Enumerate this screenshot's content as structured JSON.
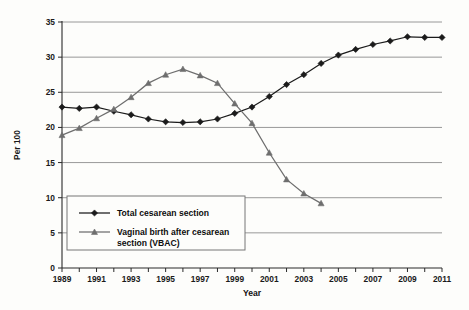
{
  "chart_data": {
    "type": "line",
    "title": "",
    "xlabel": "Year",
    "ylabel": "Per 100",
    "xlim": [
      1989,
      2011
    ],
    "ylim": [
      0,
      35
    ],
    "grid": true,
    "legend_position": "inside lower-left",
    "x": [
      1989,
      1990,
      1991,
      1992,
      1993,
      1994,
      1995,
      1996,
      1997,
      1998,
      1999,
      2000,
      2001,
      2002,
      2003,
      2004,
      2005,
      2006,
      2007,
      2008,
      2009,
      2010,
      2011
    ],
    "y_ticks": [
      0,
      5,
      10,
      15,
      20,
      25,
      30,
      35
    ],
    "x_tick_labels": [
      "1989",
      "",
      "1991",
      "",
      "1993",
      "",
      "1995",
      "",
      "1997",
      "",
      "1999",
      "",
      "2001",
      "",
      "2003",
      "",
      "2005",
      "",
      "2007",
      "",
      "2009",
      "",
      "2011"
    ],
    "series": [
      {
        "name": "Total cesarean section",
        "marker": "diamond",
        "color": "#1b1b1b",
        "x": [
          1989,
          1990,
          1991,
          1992,
          1993,
          1994,
          1995,
          1996,
          1997,
          1998,
          1999,
          2000,
          2001,
          2002,
          2003,
          2004,
          2005,
          2006,
          2007,
          2008,
          2009,
          2010,
          2011
        ],
        "values": [
          22.9,
          22.7,
          22.9,
          22.3,
          21.8,
          21.2,
          20.8,
          20.7,
          20.8,
          21.2,
          22.0,
          22.9,
          24.4,
          26.1,
          27.5,
          29.1,
          30.3,
          31.1,
          31.8,
          32.3,
          32.9,
          32.8,
          32.8
        ]
      },
      {
        "name": "Vaginal birth after cesarean section (VBAC)",
        "marker": "triangle",
        "color": "#6e6e6e",
        "x": [
          1989,
          1990,
          1991,
          1992,
          1993,
          1994,
          1995,
          1996,
          1997,
          1998,
          1999,
          2000,
          2001,
          2002,
          2003,
          2004
        ],
        "values": [
          18.9,
          19.9,
          21.3,
          22.6,
          24.3,
          26.3,
          27.5,
          28.3,
          27.4,
          26.3,
          23.4,
          20.6,
          16.4,
          12.6,
          10.6,
          9.2
        ]
      }
    ]
  },
  "legend": {
    "entries": [
      {
        "label": "Total cesarean section",
        "marker": "diamond"
      },
      {
        "label": "Vaginal birth after cesarean",
        "label2": "section (VBAC)",
        "marker": "triangle"
      }
    ]
  },
  "axis_titles": {
    "x": "Year",
    "y": "Per 100"
  },
  "colors": {
    "series_a": "#1b1b1b",
    "series_b": "#6e6e6e",
    "grid": "#8d8d8d",
    "axis": "#2a2a2a",
    "background": "#fdfdfb"
  }
}
